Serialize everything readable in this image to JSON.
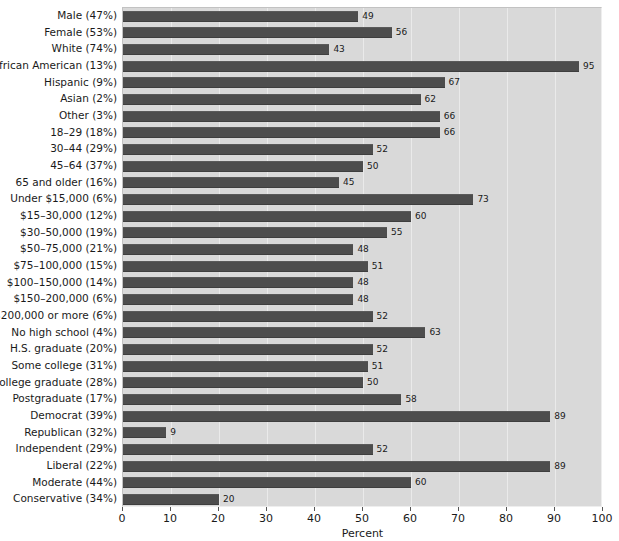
{
  "chart_data": {
    "type": "bar",
    "orientation": "horizontal",
    "title": "",
    "subtitle": "",
    "xlabel": "Percent",
    "ylabel": "",
    "xlim": [
      0,
      100
    ],
    "xticks": [
      0,
      10,
      20,
      30,
      40,
      50,
      60,
      70,
      80,
      90,
      100
    ],
    "xtick_labels": [
      "0",
      "10",
      "20",
      "30",
      "40",
      "50",
      "60",
      "70",
      "80",
      "90",
      "100"
    ],
    "grid": true,
    "grid_axis": "x",
    "legend": null,
    "legend_position": "none",
    "bar_color": "#4d4d4d",
    "plot_background": "#d9d9d9",
    "figure_background": "#ffffff",
    "show_value_labels": true,
    "categories": [
      "Male (47%)",
      "Female (53%)",
      "White (74%)",
      "African American (13%)",
      "Hispanic (9%)",
      "Asian (2%)",
      "Other (3%)",
      "18–29 (18%)",
      "30–44 (29%)",
      "45–64 (37%)",
      "65 and older (16%)",
      "Under $15,000 (6%)",
      "$15–30,000 (12%)",
      "$30–50,000 (19%)",
      "$50–75,000 (21%)",
      "$75–100,000 (15%)",
      "$100–150,000 (14%)",
      "$150–200,000 (6%)",
      "$200,000 or more (6%)",
      "No high school (4%)",
      "H.S. graduate (20%)",
      "Some college (31%)",
      "College graduate (28%)",
      "Postgraduate (17%)",
      "Democrat (39%)",
      "Republican (32%)",
      "Independent (29%)",
      "Liberal (22%)",
      "Moderate (44%)",
      "Conservative (34%)"
    ],
    "values": [
      49,
      56,
      43,
      95,
      67,
      62,
      66,
      66,
      52,
      50,
      45,
      73,
      60,
      55,
      48,
      51,
      48,
      48,
      52,
      63,
      52,
      51,
      50,
      58,
      89,
      9,
      52,
      89,
      60,
      20
    ],
    "value_labels": [
      "49",
      "56",
      "43",
      "95",
      "67",
      "62",
      "66",
      "66",
      "52",
      "50",
      "45",
      "73",
      "60",
      "55",
      "48",
      "51",
      "48",
      "48",
      "52",
      "63",
      "52",
      "51",
      "50",
      "58",
      "89",
      "9",
      "52",
      "89",
      "60",
      "20"
    ]
  }
}
